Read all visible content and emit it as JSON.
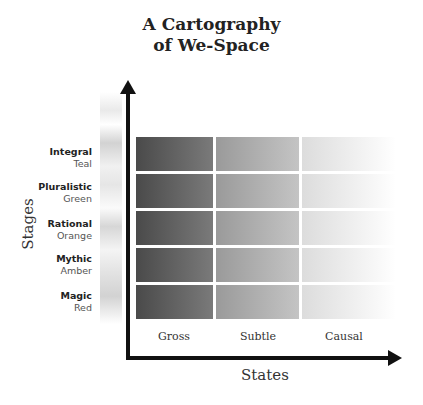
{
  "title": {
    "line1": "A Cartography",
    "line2": "of We-Space"
  },
  "axes": {
    "y_label": "Stages",
    "x_label": "States"
  },
  "stages": [
    {
      "name": "Integral",
      "color": "Teal"
    },
    {
      "name": "Pluralistic",
      "color": "Green"
    },
    {
      "name": "Rational",
      "color": "Orange"
    },
    {
      "name": "Mythic",
      "color": "Amber"
    },
    {
      "name": "Magic",
      "color": "Red"
    }
  ],
  "states": [
    "Gross",
    "Subtle",
    "Causal"
  ],
  "colors": {
    "axis": "#111111",
    "cell_gross": "#4a4a4a",
    "cell_subtle": "#9a9a9a",
    "cell_causal": "#dcdcdc"
  }
}
